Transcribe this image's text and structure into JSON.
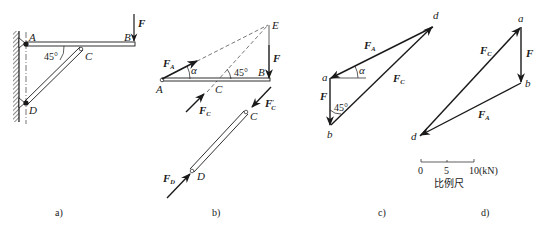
{
  "figure": {
    "panels": [
      {
        "id": "a",
        "caption": "a)",
        "points": {
          "A": "A",
          "B": "B",
          "C": "C",
          "D": "D"
        },
        "force": {
          "name": "F"
        },
        "angle": "45°"
      },
      {
        "id": "b",
        "caption": "b)",
        "points": {
          "A": "A",
          "B": "B",
          "C": "C",
          "C2": "C",
          "D": "D",
          "E": "E"
        },
        "forces": {
          "FA": {
            "main": "F",
            "sub": "A"
          },
          "F": {
            "main": "F"
          },
          "FC": {
            "main": "F",
            "sub": "C"
          },
          "FCp": {
            "main": "F",
            "sub": "C",
            "prime": "′"
          },
          "FD": {
            "main": "F",
            "sub": "D"
          }
        },
        "angles": {
          "alpha": "α",
          "deg45": "45°"
        }
      },
      {
        "id": "c",
        "caption": "c)",
        "points": {
          "a": "a",
          "b": "b",
          "d": "d"
        },
        "forces": {
          "F": {
            "main": "F"
          },
          "FA": {
            "main": "F",
            "sub": "A"
          },
          "FC": {
            "main": "F",
            "sub": "C"
          }
        },
        "angles": {
          "alpha": "α",
          "deg45": "45°"
        }
      },
      {
        "id": "d",
        "caption": "d)",
        "points": {
          "a": "a",
          "b": "b",
          "d": "d"
        },
        "forces": {
          "F": {
            "main": "F"
          },
          "FA": {
            "main": "F",
            "sub": "A"
          },
          "FC": {
            "main": "F",
            "sub": "C"
          }
        },
        "scale_bar": {
          "ticks": [
            "0",
            "5",
            "10(kN)"
          ],
          "label": "比例尺"
        }
      }
    ]
  }
}
